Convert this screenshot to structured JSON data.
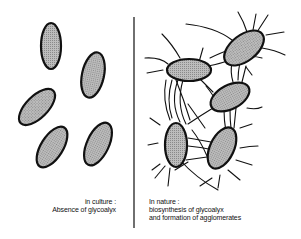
{
  "left_panel": {
    "title": "in culture :",
    "subtitle": "Absence of glycoalyx"
  },
  "right_panel": {
    "title": "In nature :",
    "line1": "biosynthesis of glycoalyx",
    "line2": "and formation of agglomerates"
  },
  "colors": {
    "cell_fill": "#a9a9a9",
    "outline": "#111111"
  }
}
